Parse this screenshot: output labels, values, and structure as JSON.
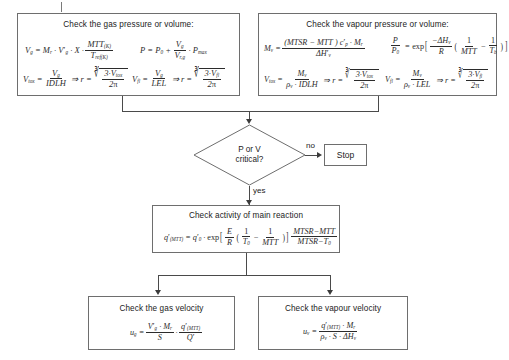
{
  "diagram": {
    "nodes": {
      "gas_pressure": {
        "title": "Check the gas pressure or volume:",
        "eq1_label": "V_g = M_r · V'_g · X · MTT_(K) / T_ref(K)",
        "eq2_label": "P = P_0 + V_g / V_r,g · P_max",
        "eq3_label": "V_tox = V_g / IDLH  =>  r = cbrt(3·V_tox / 2pi)",
        "eq4_label": "V_fl = V_g / LEL  =>  r = cbrt(3·V_fl / 2pi)"
      },
      "vapour_pressure": {
        "title": "Check the vapour pressure or volume:",
        "eq1_label": "M_v = (MTSR - MTT) · c'_p · M_r / dH'_v",
        "eq2_label": "P / P_0 = exp[ -dH_v / R ( 1/MTT - 1/T_b ) ]",
        "eq3_label": "V_tox = M_v / (rho_v · IDLH)  =>  r = cbrt(3·V_tox / 2pi)",
        "eq4_label": "V_fl = M_v / (rho_v · LEL)  =>  r = cbrt(3·V_fl / 2pi)"
      },
      "decision": {
        "line1": "P or V",
        "line2": "critical?"
      },
      "stop": {
        "label": "Stop"
      },
      "main_reaction": {
        "title": "Check activity of main reaction",
        "eq_label": "q'_(MTT) = q'_0 · exp[ E/R ( 1/T_0 - 1/MTT ) ] · (MTSR - MTT)/(MTSR - T_0)"
      },
      "gas_velocity": {
        "title": "Check the gas velocity",
        "eq_label": "u_g = V'_g · M_r / S · q'_(MTT) / Q'"
      },
      "vapour_velocity": {
        "title": "Check the vapour velocity",
        "eq_label": "u_v = q'_(MTT) · M_r / (rho_v · S · dH_v)"
      }
    },
    "edges": {
      "no_label": "no",
      "yes_label": "yes"
    },
    "colors": {
      "box_border": "#6e6e6e",
      "connector": "#4a4a4a",
      "text": "#1b1b1b",
      "math_text": "#2b2b2b",
      "background": "#ffffff"
    }
  }
}
